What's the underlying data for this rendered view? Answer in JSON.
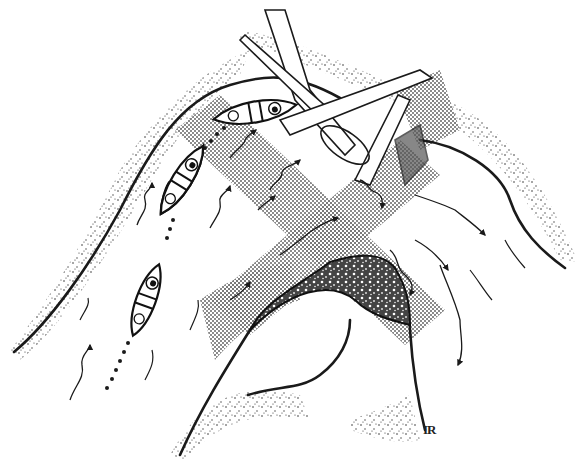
{
  "illustration": {
    "subject": "canoes navigating river bend around strainer and rock",
    "signature": "IR",
    "colors": {
      "ink": "#1a1a1a",
      "screen": "#9a9a9a",
      "background": "#ffffff"
    },
    "elements": {
      "canoes": 3,
      "strainer": "fallen logs",
      "rock": "rough textured boulder",
      "path": "dotted route line"
    }
  }
}
